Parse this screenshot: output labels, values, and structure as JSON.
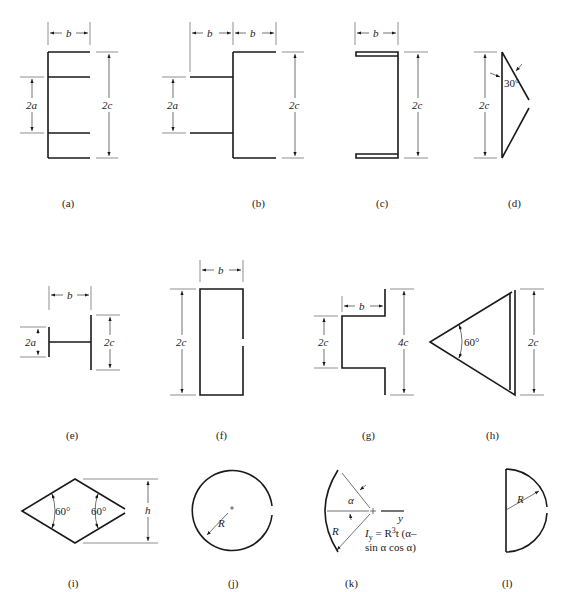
{
  "figures": [
    {
      "id": "a",
      "caption": "(a)",
      "dims": {
        "b": "b",
        "a": "2a",
        "c": "2c"
      }
    },
    {
      "id": "b",
      "caption": "(b)",
      "dims": {
        "b1": "b",
        "b2": "b",
        "a": "2a",
        "c": "2c"
      }
    },
    {
      "id": "c",
      "caption": "(c)",
      "dims": {
        "b": "b",
        "c": "2c"
      }
    },
    {
      "id": "d",
      "caption": "(d)",
      "dims": {
        "c": "2c",
        "angle": "30°"
      }
    },
    {
      "id": "e",
      "caption": "(e)",
      "dims": {
        "b": "b",
        "a": "2a",
        "c": "2c"
      }
    },
    {
      "id": "f",
      "caption": "(f)",
      "dims": {
        "b": "b",
        "c": "2c"
      }
    },
    {
      "id": "g",
      "caption": "(g)",
      "dims": {
        "b": "b",
        "c": "2c",
        "c4": "4c"
      }
    },
    {
      "id": "h",
      "caption": "(h)",
      "dims": {
        "angle": "60°",
        "c": "2c"
      }
    },
    {
      "id": "i",
      "caption": "(i)",
      "dims": {
        "angle1": "60°",
        "angle2": "60°",
        "h": "h"
      }
    },
    {
      "id": "j",
      "caption": "(j)",
      "dims": {
        "R": "R"
      }
    },
    {
      "id": "k",
      "caption": "(k)",
      "dims": {
        "alpha": "α",
        "R": "R",
        "y": "y"
      },
      "formula": {
        "line1": "I",
        "sub": "y",
        "line1b": " = R",
        "sup": "3",
        "line1c": "t (α–",
        "line2": "sin α cos α)"
      }
    },
    {
      "id": "l",
      "caption": "(l)",
      "dims": {
        "R": "R"
      }
    }
  ]
}
